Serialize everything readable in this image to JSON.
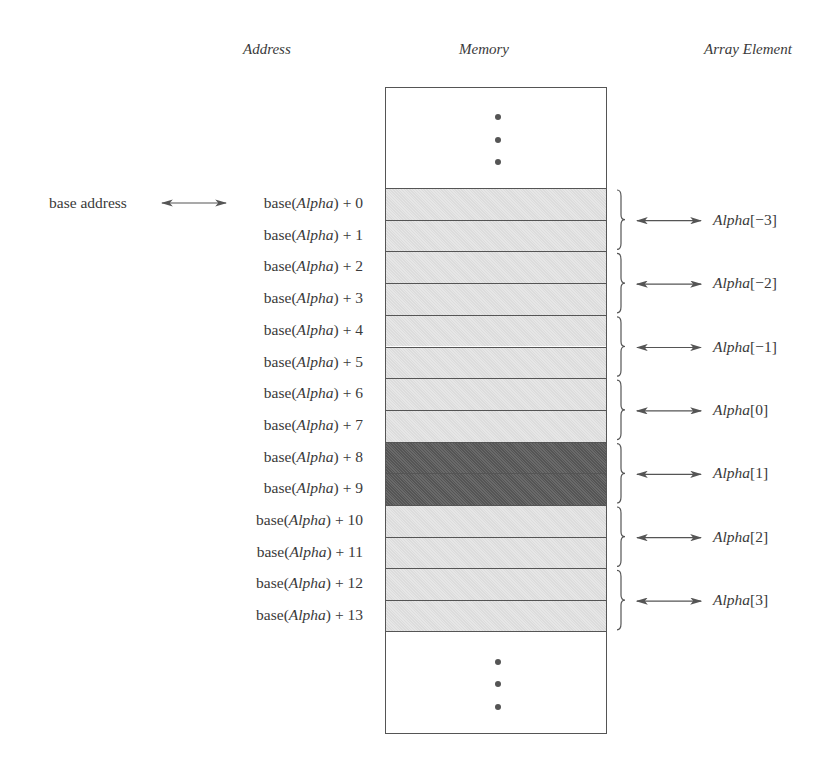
{
  "headers": {
    "address": "Address",
    "memory": "Memory",
    "element": "Array Element"
  },
  "base_label": "base address",
  "address_prefix": "base(",
  "address_var": "Alpha",
  "addresses": [
    {
      "pre": "base(",
      "var": "Alpha",
      "post": ") + 0"
    },
    {
      "pre": "base(",
      "var": "Alpha",
      "post": ") + 1"
    },
    {
      "pre": "base(",
      "var": "Alpha",
      "post": ") + 2"
    },
    {
      "pre": "base(",
      "var": "Alpha",
      "post": ") + 3"
    },
    {
      "pre": "base(",
      "var": "Alpha",
      "post": ") + 4"
    },
    {
      "pre": "base(",
      "var": "Alpha",
      "post": ") + 5"
    },
    {
      "pre": "base(",
      "var": "Alpha",
      "post": ") + 6"
    },
    {
      "pre": "base(",
      "var": "Alpha",
      "post": ") + 7"
    },
    {
      "pre": "base(",
      "var": "Alpha",
      "post": ") + 8"
    },
    {
      "pre": "base(",
      "var": "Alpha",
      "post": ") + 9"
    },
    {
      "pre": "base(",
      "var": "Alpha",
      "post": ") + 10"
    },
    {
      "pre": "base(",
      "var": "Alpha",
      "post": ") + 11"
    },
    {
      "pre": "base(",
      "var": "Alpha",
      "post": ") + 12"
    },
    {
      "pre": "base(",
      "var": "Alpha",
      "post": ") + 13"
    }
  ],
  "elements": [
    {
      "var": "Alpha",
      "index": "[−3]"
    },
    {
      "var": "Alpha",
      "index": "[−2]"
    },
    {
      "var": "Alpha",
      "index": "[−1]"
    },
    {
      "var": "Alpha",
      "index": "[0]"
    },
    {
      "var": "Alpha",
      "index": "[1]"
    },
    {
      "var": "Alpha",
      "index": "[2]"
    },
    {
      "var": "Alpha",
      "index": "[3]"
    }
  ],
  "highlighted_element_index": 4,
  "colors": {
    "cell_light": "#e0e0e0",
    "cell_dark": "#5e5e5e",
    "line": "#555555"
  }
}
